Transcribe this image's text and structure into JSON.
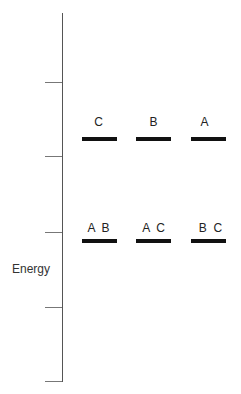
{
  "diagram": {
    "type": "energy-level-diagram",
    "axis_label": "Energy",
    "ticks": [
      82,
      156,
      232,
      307,
      382
    ],
    "upper_levels": [
      {
        "label": "C"
      },
      {
        "label": "B"
      },
      {
        "label": "A"
      }
    ],
    "lower_levels": [
      {
        "label": "A  B"
      },
      {
        "label": "A  C"
      },
      {
        "label": "B  C"
      }
    ]
  }
}
